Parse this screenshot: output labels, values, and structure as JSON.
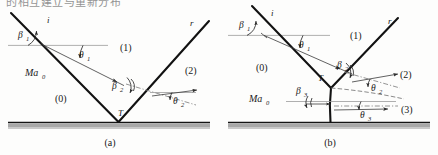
{
  "page": {
    "header_text": "的相互建立与重新分布",
    "background_color": "#fdfdfc",
    "shock_color": "#121212",
    "ground_color": "#a8a8a8"
  },
  "figure": {
    "panels": [
      {
        "id": "a",
        "caption": "(a)",
        "type": "regular-reflection",
        "labels": {
          "incident_ray": "i",
          "reflected_ray": "r",
          "triple_point": "T",
          "freestream": "Ma",
          "freestream_sub": "0",
          "regions": [
            "(0)",
            "(1)",
            "(2)"
          ],
          "angles": [
            {
              "symbol": "β",
              "sub": "1"
            },
            {
              "symbol": "θ",
              "sub": "1"
            },
            {
              "symbol": "β",
              "sub": "2"
            },
            {
              "symbol": "θ",
              "sub": "2"
            }
          ]
        }
      },
      {
        "id": "b",
        "caption": "(b)",
        "type": "mach-reflection",
        "labels": {
          "incident_ray": "i",
          "reflected_ray": "r",
          "triple_point": "T",
          "freestream": "Ma",
          "freestream_sub": "0",
          "regions": [
            "(0)",
            "(1)",
            "(2)",
            "(3)"
          ],
          "angles": [
            {
              "symbol": "β",
              "sub": "1"
            },
            {
              "symbol": "θ",
              "sub": "1"
            },
            {
              "symbol": "β",
              "sub": "2"
            },
            {
              "symbol": "θ",
              "sub": "2"
            },
            {
              "symbol": "β",
              "sub": "3"
            },
            {
              "symbol": "θ",
              "sub": "3"
            }
          ]
        }
      }
    ]
  }
}
